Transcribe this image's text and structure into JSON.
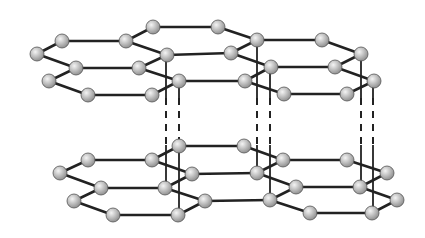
{
  "diagram": {
    "colors": {
      "bond": "#222222",
      "atom_fill_light": "#f4f4f4",
      "atom_fill_dark": "#8a8a8a",
      "atom_stroke": "#555555",
      "background": "#ffffff"
    },
    "atom_radius": 7,
    "layers": [
      {
        "name": "top-layer",
        "atoms": [
          [
            37,
            54
          ],
          [
            62,
            41
          ],
          [
            126,
            41
          ],
          [
            153,
            27
          ],
          [
            218,
            27
          ],
          [
            257,
            40
          ],
          [
            322,
            40
          ],
          [
            361,
            54
          ],
          [
            76,
            68
          ],
          [
            139,
            68
          ],
          [
            167,
            55
          ],
          [
            231,
            53
          ],
          [
            271,
            67
          ],
          [
            335,
            67
          ],
          [
            49,
            81
          ],
          [
            179,
            81
          ],
          [
            245,
            81
          ],
          [
            374,
            81
          ],
          [
            88,
            95
          ],
          [
            152,
            95
          ],
          [
            284,
            94
          ],
          [
            347,
            94
          ]
        ],
        "bonds": [
          [
            [
              37,
              54
            ],
            [
              62,
              41
            ]
          ],
          [
            [
              62,
              41
            ],
            [
              126,
              41
            ]
          ],
          [
            [
              126,
              41
            ],
            [
              167,
              55
            ]
          ],
          [
            [
              126,
              41
            ],
            [
              153,
              27
            ]
          ],
          [
            [
              153,
              27
            ],
            [
              218,
              27
            ]
          ],
          [
            [
              218,
              27
            ],
            [
              257,
              40
            ]
          ],
          [
            [
              257,
              40
            ],
            [
              322,
              40
            ]
          ],
          [
            [
              322,
              40
            ],
            [
              361,
              54
            ]
          ],
          [
            [
              37,
              54
            ],
            [
              76,
              68
            ]
          ],
          [
            [
              76,
              68
            ],
            [
              139,
              68
            ]
          ],
          [
            [
              139,
              68
            ],
            [
              167,
              55
            ]
          ],
          [
            [
              167,
              55
            ],
            [
              231,
              53
            ]
          ],
          [
            [
              231,
              53
            ],
            [
              271,
              67
            ]
          ],
          [
            [
              257,
              40
            ],
            [
              231,
              53
            ]
          ],
          [
            [
              271,
              67
            ],
            [
              335,
              67
            ]
          ],
          [
            [
              335,
              67
            ],
            [
              361,
              54
            ]
          ],
          [
            [
              76,
              68
            ],
            [
              49,
              81
            ]
          ],
          [
            [
              49,
              81
            ],
            [
              88,
              95
            ]
          ],
          [
            [
              88,
              95
            ],
            [
              152,
              95
            ]
          ],
          [
            [
              152,
              95
            ],
            [
              179,
              81
            ]
          ],
          [
            [
              139,
              68
            ],
            [
              179,
              81
            ]
          ],
          [
            [
              179,
              81
            ],
            [
              245,
              81
            ]
          ],
          [
            [
              245,
              81
            ],
            [
              271,
              67
            ]
          ],
          [
            [
              245,
              81
            ],
            [
              284,
              94
            ]
          ],
          [
            [
              284,
              94
            ],
            [
              347,
              94
            ]
          ],
          [
            [
              347,
              94
            ],
            [
              374,
              81
            ]
          ],
          [
            [
              335,
              67
            ],
            [
              374,
              81
            ]
          ]
        ]
      },
      {
        "name": "bottom-layer",
        "atoms": [
          [
            88,
            160
          ],
          [
            152,
            160
          ],
          [
            179,
            146
          ],
          [
            244,
            146
          ],
          [
            283,
            160
          ],
          [
            347,
            160
          ],
          [
            387,
            173
          ],
          [
            60,
            173
          ],
          [
            101,
            188
          ],
          [
            165,
            188
          ],
          [
            192,
            174
          ],
          [
            257,
            173
          ],
          [
            74,
            201
          ],
          [
            205,
            201
          ],
          [
            270,
            200
          ],
          [
            397,
            200
          ],
          [
            296,
            187
          ],
          [
            360,
            187
          ],
          [
            113,
            215
          ],
          [
            178,
            215
          ],
          [
            310,
            213
          ],
          [
            372,
            213
          ]
        ],
        "bonds": [
          [
            [
              60,
              173
            ],
            [
              88,
              160
            ]
          ],
          [
            [
              88,
              160
            ],
            [
              152,
              160
            ]
          ],
          [
            [
              152,
              160
            ],
            [
              179,
              146
            ]
          ],
          [
            [
              179,
              146
            ],
            [
              244,
              146
            ]
          ],
          [
            [
              244,
              146
            ],
            [
              283,
              160
            ]
          ],
          [
            [
              283,
              160
            ],
            [
              347,
              160
            ]
          ],
          [
            [
              347,
              160
            ],
            [
              387,
              173
            ]
          ],
          [
            [
              152,
              160
            ],
            [
              192,
              174
            ]
          ],
          [
            [
              60,
              173
            ],
            [
              101,
              188
            ]
          ],
          [
            [
              101,
              188
            ],
            [
              165,
              188
            ]
          ],
          [
            [
              165,
              188
            ],
            [
              192,
              174
            ]
          ],
          [
            [
              192,
              174
            ],
            [
              257,
              173
            ]
          ],
          [
            [
              257,
              173
            ],
            [
              283,
              160
            ]
          ],
          [
            [
              257,
              173
            ],
            [
              296,
              187
            ]
          ],
          [
            [
              296,
              187
            ],
            [
              360,
              187
            ]
          ],
          [
            [
              360,
              187
            ],
            [
              387,
              173
            ]
          ],
          [
            [
              101,
              188
            ],
            [
              74,
              201
            ]
          ],
          [
            [
              74,
              201
            ],
            [
              113,
              215
            ]
          ],
          [
            [
              113,
              215
            ],
            [
              178,
              215
            ]
          ],
          [
            [
              178,
              215
            ],
            [
              205,
              201
            ]
          ],
          [
            [
              165,
              188
            ],
            [
              205,
              201
            ]
          ],
          [
            [
              205,
              201
            ],
            [
              270,
              200
            ]
          ],
          [
            [
              270,
              200
            ],
            [
              296,
              187
            ]
          ],
          [
            [
              270,
              200
            ],
            [
              310,
              213
            ]
          ],
          [
            [
              310,
              213
            ],
            [
              372,
              213
            ]
          ],
          [
            [
              372,
              213
            ],
            [
              397,
              200
            ]
          ],
          [
            [
              360,
              187
            ],
            [
              397,
              200
            ]
          ]
        ]
      }
    ],
    "interlayer_links": [
      {
        "x": 166,
        "top": 55,
        "dash_start": 98,
        "dash_end": 145,
        "bottom": 188
      },
      {
        "x": 179,
        "top": 81,
        "dash_start": 98,
        "dash_end": 145,
        "bottom": 215
      },
      {
        "x": 257,
        "top": 40,
        "dash_start": 98,
        "dash_end": 145,
        "bottom": 173
      },
      {
        "x": 270,
        "top": 67,
        "dash_start": 98,
        "dash_end": 145,
        "bottom": 200
      },
      {
        "x": 361,
        "top": 54,
        "dash_start": 98,
        "dash_end": 145,
        "bottom": 187
      },
      {
        "x": 373,
        "top": 81,
        "dash_start": 98,
        "dash_end": 145,
        "bottom": 213
      }
    ]
  }
}
